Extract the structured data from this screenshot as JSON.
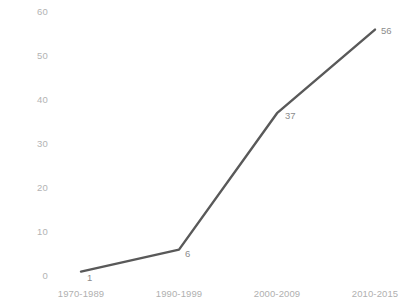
{
  "chart_data": {
    "type": "line",
    "title": "",
    "subtitle": "",
    "xlabel": "",
    "ylabel": "",
    "categories": [
      "1970-1989",
      "1990-1999",
      "2000-2009",
      "2010-2015"
    ],
    "values": [
      1,
      6,
      37,
      56
    ],
    "point_labels": [
      "1",
      "6",
      "37",
      "56"
    ],
    "ylim": [
      0,
      60
    ],
    "yticks": [
      0,
      10,
      20,
      30,
      40,
      50,
      60
    ],
    "ytick_labels": [
      "0",
      "10",
      "20",
      "30",
      "40",
      "50",
      "60"
    ],
    "grid": false,
    "legend": false,
    "legend_position": "none",
    "series": [
      {
        "name": "",
        "values": [
          1,
          6,
          37,
          56
        ]
      }
    ]
  },
  "style": {
    "line_color": "#595959",
    "label_color": "#8c8c8c",
    "tick_color": "#b3b3b3",
    "background": "#ffffff"
  }
}
